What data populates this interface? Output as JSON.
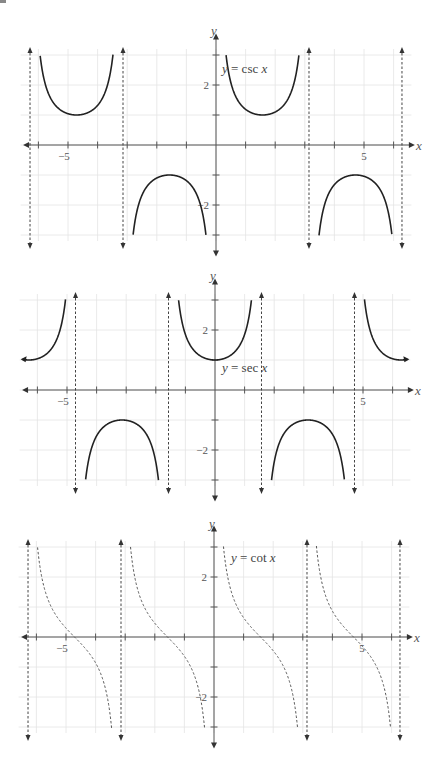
{
  "chart_data": [
    {
      "type": "line",
      "title": "",
      "function": "csc",
      "equation_label": {
        "y": "y",
        "eq": " = csc ",
        "x": "x"
      },
      "xlabel": "x",
      "ylabel": "y",
      "x_tick_labels": [
        {
          "value": -5,
          "text": "−5"
        },
        {
          "value": 5,
          "text": "5"
        }
      ],
      "y_tick_labels": [
        {
          "value": 2,
          "text": "2"
        },
        {
          "value": -2,
          "text": "−2"
        }
      ],
      "xlim": [
        -6.5,
        6.5
      ],
      "ylim": [
        -3.2,
        3.2
      ],
      "grid": true,
      "asymptotes": [
        "-2π",
        "-π",
        "π",
        "2π"
      ],
      "asymptote_values": [
        -6.2832,
        -3.1416,
        3.1416,
        6.2832
      ],
      "extrema": [
        {
          "x": -4.712,
          "y": 1
        },
        {
          "x": -1.571,
          "y": -1
        },
        {
          "x": 1.571,
          "y": 1
        },
        {
          "x": 4.712,
          "y": -1
        }
      ],
      "curve_style": "solid"
    },
    {
      "type": "line",
      "title": "",
      "function": "sec",
      "equation_label": {
        "y": "y",
        "eq": " = sec ",
        "x": "x"
      },
      "xlabel": "x",
      "ylabel": "y",
      "x_tick_labels": [
        {
          "value": -5,
          "text": "−5"
        },
        {
          "value": 5,
          "text": "5"
        }
      ],
      "y_tick_labels": [
        {
          "value": 2,
          "text": "2"
        },
        {
          "value": -2,
          "text": "−2"
        }
      ],
      "xlim": [
        -6.5,
        6.5
      ],
      "ylim": [
        -3.2,
        3.2
      ],
      "grid": true,
      "asymptotes": [
        "-3π/2",
        "-π/2",
        "π/2",
        "3π/2"
      ],
      "asymptote_values": [
        -4.7124,
        -1.5708,
        1.5708,
        4.7124
      ],
      "extrema": [
        {
          "x": -3.1416,
          "y": -1
        },
        {
          "x": 0,
          "y": 1
        },
        {
          "x": 3.1416,
          "y": -1
        }
      ],
      "curve_style": "solid"
    },
    {
      "type": "line",
      "title": "",
      "function": "cot",
      "equation_label": {
        "y": "y",
        "eq": " = cot ",
        "x": "x"
      },
      "xlabel": "x",
      "ylabel": "y",
      "x_tick_labels": [
        {
          "value": -5,
          "text": "−5"
        },
        {
          "value": 5,
          "text": "5"
        }
      ],
      "y_tick_labels": [
        {
          "value": 2,
          "text": "2"
        },
        {
          "value": -2,
          "text": "−2"
        }
      ],
      "xlim": [
        -6.5,
        6.5
      ],
      "ylim": [
        -3.2,
        3.2
      ],
      "grid": true,
      "asymptotes": [
        "-2π",
        "-π",
        "0",
        "π",
        "2π"
      ],
      "asymptote_values": [
        -6.2832,
        -3.1416,
        3.1416,
        6.2832
      ],
      "zeros": [
        -4.712,
        -1.571,
        1.571,
        4.712
      ],
      "curve_style": "dashed"
    }
  ],
  "layout": {
    "graphs": [
      {
        "ox": 216,
        "oy": 145,
        "ux": 29.6,
        "uy": 30,
        "label_pos": [
          222,
          73
        ],
        "ylabel_pos": [
          211,
          35
        ],
        "xlabel_pos": [
          416,
          150
        ]
      },
      {
        "ox": 215,
        "oy": 390,
        "ux": 29.6,
        "uy": 30,
        "label_pos": [
          222,
          372
        ],
        "ylabel_pos": [
          210,
          280
        ],
        "xlabel_pos": [
          415,
          395
        ]
      },
      {
        "ox": 214,
        "oy": 637,
        "ux": 29.6,
        "uy": 30,
        "label_pos": [
          231,
          562
        ],
        "ylabel_pos": [
          209,
          528
        ],
        "xlabel_pos": [
          414,
          642
        ]
      }
    ]
  }
}
